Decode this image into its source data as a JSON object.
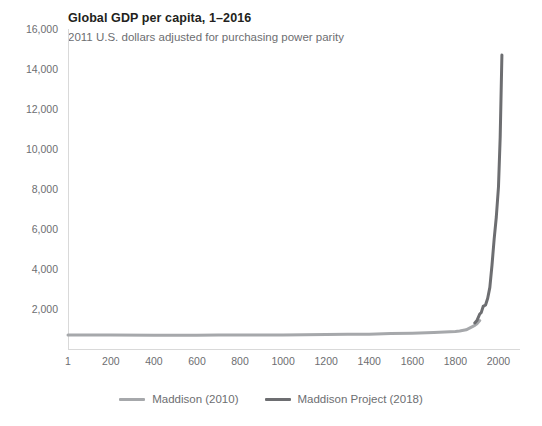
{
  "chart_data": {
    "type": "line",
    "title": "Global GDP per capita, 1–2016",
    "subtitle": "2011 U.S. dollars adjusted for purchasing power parity",
    "xlabel": "",
    "ylabel": "",
    "xlim": [
      1,
      2100
    ],
    "ylim": [
      0,
      16000
    ],
    "grid": false,
    "legend_position": "bottom-center",
    "y_ticks": [
      {
        "value": 0,
        "label": ""
      },
      {
        "value": 2000,
        "label": "2,000"
      },
      {
        "value": 4000,
        "label": "4,000"
      },
      {
        "value": 6000,
        "label": "6,000"
      },
      {
        "value": 8000,
        "label": "8,000"
      },
      {
        "value": 10000,
        "label": "10,000"
      },
      {
        "value": 12000,
        "label": "12,000"
      },
      {
        "value": 14000,
        "label": "14,000"
      },
      {
        "value": 16000,
        "label": "16,000"
      }
    ],
    "x_ticks": [
      {
        "value": 1,
        "label": "1"
      },
      {
        "value": 200,
        "label": "200"
      },
      {
        "value": 400,
        "label": "400"
      },
      {
        "value": 600,
        "label": "600"
      },
      {
        "value": 800,
        "label": "800"
      },
      {
        "value": 1000,
        "label": "1000"
      },
      {
        "value": 1200,
        "label": "1200"
      },
      {
        "value": 1400,
        "label": "1400"
      },
      {
        "value": 1600,
        "label": "1600"
      },
      {
        "value": 1800,
        "label": "1800"
      },
      {
        "value": 2000,
        "label": "2000"
      }
    ],
    "series": [
      {
        "name": "Maddison (2010)",
        "color": "#a6a8ab",
        "points": [
          [
            1,
            700
          ],
          [
            200,
            700
          ],
          [
            400,
            690
          ],
          [
            600,
            690
          ],
          [
            700,
            700
          ],
          [
            800,
            700
          ],
          [
            900,
            700
          ],
          [
            1000,
            700
          ],
          [
            1100,
            710
          ],
          [
            1200,
            730
          ],
          [
            1300,
            740
          ],
          [
            1400,
            740
          ],
          [
            1500,
            770
          ],
          [
            1600,
            790
          ],
          [
            1700,
            830
          ],
          [
            1750,
            850
          ],
          [
            1800,
            880
          ],
          [
            1820,
            900
          ],
          [
            1850,
            960
          ],
          [
            1870,
            1070
          ],
          [
            1890,
            1180
          ],
          [
            1900,
            1260
          ],
          [
            1913,
            1420
          ]
        ]
      },
      {
        "name": "Maddison Project (2018)",
        "color": "#6d6e71",
        "points": [
          [
            1890,
            1300
          ],
          [
            1900,
            1420
          ],
          [
            1913,
            1750
          ],
          [
            1920,
            1820
          ],
          [
            1929,
            2130
          ],
          [
            1940,
            2200
          ],
          [
            1950,
            2540
          ],
          [
            1960,
            3080
          ],
          [
            1970,
            4200
          ],
          [
            1980,
            5500
          ],
          [
            1990,
            6600
          ],
          [
            2000,
            8100
          ],
          [
            2008,
            10600
          ],
          [
            2016,
            14700
          ]
        ]
      }
    ]
  },
  "legend": {
    "items": [
      {
        "label": "Maddison (2010)",
        "color": "#a6a8ab"
      },
      {
        "label": "Maddison Project (2018)",
        "color": "#6d6e71"
      }
    ]
  }
}
